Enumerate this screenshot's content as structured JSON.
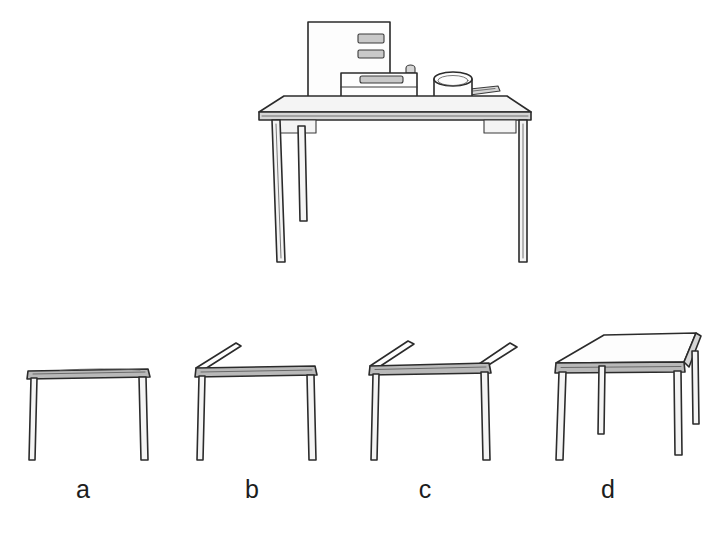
{
  "figure": {
    "kind": "line-drawing",
    "background_color": "#ffffff",
    "ink_color": "#2b2b2b",
    "fill_light": "#f4f4f4",
    "fill_edge": "#d6d6d6",
    "title": ""
  },
  "main_scene": {
    "name": "table-with-objects",
    "objects": [
      {
        "id": "tall-box",
        "label": "tall upright box",
        "slots": 2,
        "position": "back-left of tabletop"
      },
      {
        "id": "low-box",
        "label": "low box with top slot and knob",
        "slots": 1,
        "knobs": 1,
        "position": "centre of tabletop"
      },
      {
        "id": "pot",
        "label": "round pot with side handle",
        "position": "right of tabletop"
      }
    ],
    "table": {
      "legs_visible": 3,
      "apron": true,
      "viewpoint": "slightly above eye level"
    }
  },
  "options": {
    "name": "viewpoint-series",
    "count": 4,
    "items": [
      {
        "id": "option-a",
        "label": "a",
        "viewpoint": "eye level",
        "description": "tabletop seen edge-on, no surface visible, two legs",
        "top_visible": false,
        "legs_visible": 2,
        "tilt_degrees": 0
      },
      {
        "id": "option-b",
        "label": "b",
        "viewpoint": "slightly above",
        "description": "far-left back edge of tabletop just becoming visible, two legs",
        "top_visible": true,
        "legs_visible": 2,
        "tilt_degrees": 8
      },
      {
        "id": "option-c",
        "label": "c",
        "viewpoint": "further above",
        "description": "back edge visible on both left and right, tabletop surface opening up, two legs",
        "top_visible": true,
        "legs_visible": 2,
        "tilt_degrees": 16
      },
      {
        "id": "option-d",
        "label": "d",
        "viewpoint": "high / bird's eye",
        "description": "full tabletop surface shown as a parallelogram, all four legs visible",
        "top_visible": true,
        "legs_visible": 4,
        "tilt_degrees": 32
      }
    ]
  }
}
